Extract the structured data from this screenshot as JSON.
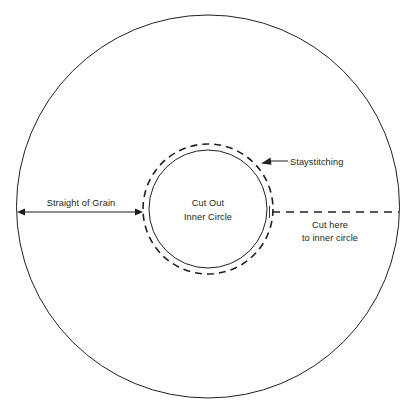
{
  "diagram": {
    "background_color": "#ffffff",
    "line_color": "#231f20",
    "canvas": {
      "width": 414,
      "height": 413
    },
    "shapes": {
      "outer_circle": {
        "name": "outer-circle",
        "cx": 208,
        "cy": 206.5,
        "r": 191.5,
        "style": "solid"
      },
      "inner_circle": {
        "name": "inner-cut-circle",
        "cx": 208,
        "cy": 209,
        "r": 59,
        "style": "solid"
      },
      "staystitch_circle": {
        "name": "staystitching-circle",
        "cx": 208,
        "cy": 209,
        "r": 65,
        "style": "dashed"
      },
      "cut_line": {
        "name": "cut-line",
        "x1": 272,
        "x2": 400,
        "y": 212,
        "style": "dashed"
      },
      "grain_arrow": {
        "name": "straight-of-grain-arrow",
        "x1": 17,
        "x2": 143,
        "y": 212,
        "style": "double-arrow"
      },
      "staystitch_leader": {
        "name": "staystitching-leader",
        "tip_x": 261,
        "tip_y": 161,
        "end_x": 288,
        "end_y": 161
      }
    },
    "labels": {
      "center": {
        "line1": "Cut Out",
        "line2": "Inner Circle"
      },
      "staystitching": "Staystitching",
      "straight_of_grain": "Straight of Grain",
      "cut_here": {
        "line1": "Cut here",
        "line2": "to inner circle"
      }
    }
  }
}
